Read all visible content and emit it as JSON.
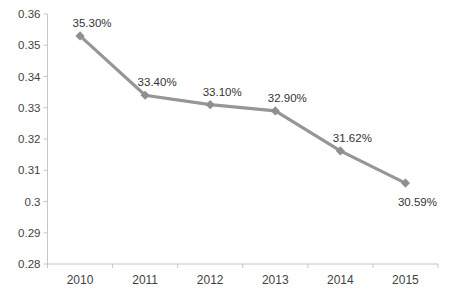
{
  "chart_data": {
    "type": "line",
    "title": "",
    "subtitle": "",
    "xlabel": "",
    "ylabel": "",
    "categories": [
      "2010",
      "2011",
      "2012",
      "2013",
      "2014",
      "2015"
    ],
    "series": [
      {
        "name": "ratio",
        "values": [
          0.353,
          0.334,
          0.331,
          0.329,
          0.3162,
          0.3059
        ]
      }
    ],
    "data_labels": [
      "35.30%",
      "33.40%",
      "33.10%",
      "32.90%",
      "31.62%",
      "30.59%"
    ],
    "label_placement": [
      "above",
      "above",
      "above",
      "above",
      "above",
      "below"
    ],
    "y_tick_labels": [
      "0.36",
      "0.35",
      "0.34",
      "0.33",
      "0.32",
      "0.31",
      "0.3",
      "0.29",
      "0.28"
    ],
    "y_tick_values": [
      0.36,
      0.35,
      0.34,
      0.33,
      0.32,
      0.31,
      0.3,
      0.29,
      0.28
    ],
    "ylim": [
      0.28,
      0.36
    ],
    "grid": false,
    "legend_position": "none",
    "marker": "diamond",
    "colors": {
      "line": "#969696",
      "marker": "#8f8f8f",
      "axis": "#c6c6c6",
      "tick_text": "#3f3f3f",
      "data_label_text": "#333333",
      "background": "#ffffff"
    }
  }
}
